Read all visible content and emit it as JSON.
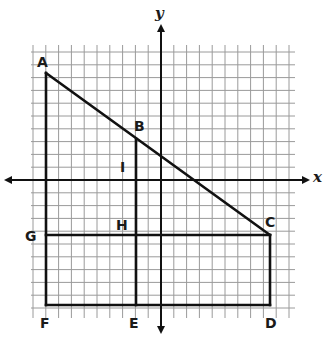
{
  "figure": {
    "type": "coordinate-grid-geometry",
    "colors": {
      "grid": "#9a9a9a",
      "lines": "#111111",
      "background": "#ffffff"
    },
    "grid": {
      "left": 31,
      "top": 45,
      "right": 295,
      "bottom": 318,
      "cell": 12.8
    },
    "axes": {
      "x_label": "x",
      "y_label": "y",
      "origin_px": [
        161,
        180
      ]
    },
    "points": [
      {
        "name": "A",
        "label": "A",
        "px": [
          46,
          73
        ]
      },
      {
        "name": "B",
        "label": "B",
        "px": [
          136,
          139
        ]
      },
      {
        "name": "C",
        "label": "C",
        "px": [
          270,
          235
        ]
      },
      {
        "name": "D",
        "label": "D",
        "px": [
          270,
          305
        ]
      },
      {
        "name": "E",
        "label": "E",
        "px": [
          136,
          305
        ]
      },
      {
        "name": "F",
        "label": "F",
        "px": [
          46,
          305
        ]
      },
      {
        "name": "G",
        "label": "G",
        "px": [
          46,
          235
        ]
      },
      {
        "name": "H",
        "label": "H",
        "px": [
          136,
          235
        ]
      },
      {
        "name": "I",
        "label": "I",
        "px": [
          136,
          168
        ]
      }
    ],
    "segments": [
      "A-C",
      "A-F",
      "F-D",
      "D-C",
      "G-C",
      "B-E"
    ]
  }
}
